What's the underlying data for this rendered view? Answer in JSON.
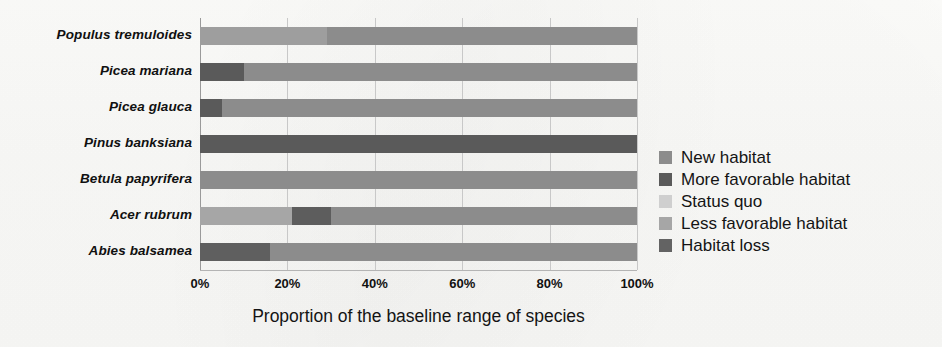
{
  "chart_data": {
    "type": "bar",
    "orientation": "horizontal",
    "stacked": true,
    "stacked_normalized": true,
    "title": "",
    "xlabel": "Proportion of the baseline range of species",
    "ylabel": "",
    "xlim": [
      0,
      100
    ],
    "xticks": [
      "0%",
      "20%",
      "40%",
      "60%",
      "80%",
      "100%"
    ],
    "xtick_values": [
      0,
      20,
      40,
      60,
      80,
      100
    ],
    "grid": true,
    "grid_axis": "x",
    "legend_position": "right",
    "categories": [
      "Populus tremuloides",
      "Picea mariana",
      "Picea glauca",
      "Pinus banksiana",
      "Betula papyrifera",
      "Acer rubrum",
      "Abies balsamea"
    ],
    "series": [
      {
        "name": "New habitat",
        "color": "#8c8c8c",
        "values": [
          0,
          0,
          0,
          0,
          0,
          0,
          0
        ]
      },
      {
        "name": "More favorable habitat",
        "color": "#5a5a5a",
        "values": [
          0,
          10,
          5,
          100,
          0,
          0,
          16
        ]
      },
      {
        "name": "Status quo",
        "color": "#cfcfcf",
        "values": [
          0,
          0,
          0,
          0,
          0,
          0,
          0
        ]
      },
      {
        "name": "Less favorable habitat",
        "color": "#9e9e9e",
        "values": [
          29,
          0,
          0,
          0,
          0,
          21,
          0
        ]
      },
      {
        "name": "Habitat loss",
        "color": "#636363",
        "values": [
          0,
          0,
          0,
          0,
          0,
          9,
          0
        ]
      }
    ],
    "bars": [
      {
        "category": "Populus tremuloides",
        "segments": [
          {
            "series": "Less favorable habitat",
            "value": 29,
            "color": "#9e9e9e"
          },
          {
            "series": "New habitat",
            "value": 71,
            "color": "#8c8c8c"
          }
        ]
      },
      {
        "category": "Picea mariana",
        "segments": [
          {
            "series": "More favorable habitat",
            "value": 10,
            "color": "#5a5a5a"
          },
          {
            "series": "New habitat",
            "value": 90,
            "color": "#8c8c8c"
          }
        ]
      },
      {
        "category": "Picea glauca",
        "segments": [
          {
            "series": "More favorable habitat",
            "value": 5,
            "color": "#5a5a5a"
          },
          {
            "series": "New habitat",
            "value": 95,
            "color": "#8c8c8c"
          }
        ]
      },
      {
        "category": "Pinus banksiana",
        "segments": [
          {
            "series": "More favorable habitat",
            "value": 100,
            "color": "#5a5a5a"
          }
        ]
      },
      {
        "category": "Betula papyrifera",
        "segments": [
          {
            "series": "New habitat",
            "value": 100,
            "color": "#8c8c8c"
          }
        ]
      },
      {
        "category": "Acer rubrum",
        "segments": [
          {
            "series": "Less favorable habitat",
            "value": 21,
            "color": "#a6a6a6"
          },
          {
            "series": "Habitat loss",
            "value": 9,
            "color": "#5d5d5d"
          },
          {
            "series": "New habitat",
            "value": 70,
            "color": "#8c8c8c"
          }
        ]
      },
      {
        "category": "Abies balsamea",
        "segments": [
          {
            "series": "More favorable habitat",
            "value": 16,
            "color": "#5f5f5f"
          },
          {
            "series": "New habitat",
            "value": 84,
            "color": "#8c8c8c"
          }
        ]
      }
    ],
    "legend": [
      {
        "label": "New habitat",
        "color": "#8c8c8c"
      },
      {
        "label": "More favorable habitat",
        "color": "#5a5a5a"
      },
      {
        "label": "Status quo",
        "color": "#cfcfcf"
      },
      {
        "label": "Less favorable habitat",
        "color": "#a6a6a6"
      },
      {
        "label": "Habitat loss",
        "color": "#636363"
      }
    ]
  }
}
